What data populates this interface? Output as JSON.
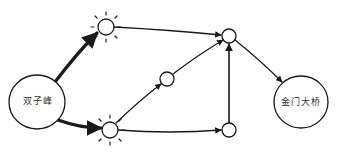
{
  "diagram": {
    "type": "directed-graph",
    "style": "hand-drawn sketch",
    "colors": {
      "stroke": "#1a1a1a",
      "background": "#ffffff",
      "text": "#333333"
    },
    "nodes": [
      {
        "id": "twin_peaks",
        "label": "双子峰",
        "kind": "large",
        "x": 37,
        "y": 102,
        "r": 27
      },
      {
        "id": "sun_top",
        "label": "",
        "kind": "highlighted",
        "x": 106,
        "y": 27,
        "r": 8
      },
      {
        "id": "sun_bottom",
        "label": "",
        "kind": "highlighted",
        "x": 110,
        "y": 130,
        "r": 8
      },
      {
        "id": "mid",
        "label": "",
        "kind": "small",
        "x": 167,
        "y": 79,
        "r": 7
      },
      {
        "id": "top_right",
        "label": "",
        "kind": "small",
        "x": 229,
        "y": 36,
        "r": 7
      },
      {
        "id": "bottom_right",
        "label": "",
        "kind": "small",
        "x": 229,
        "y": 130,
        "r": 7
      },
      {
        "id": "golden_gate",
        "label": "金门大桥",
        "kind": "large",
        "x": 301,
        "y": 102,
        "r": 26
      }
    ],
    "edges": [
      {
        "from": "twin_peaks",
        "to": "sun_top",
        "weight": "thick"
      },
      {
        "from": "twin_peaks",
        "to": "sun_bottom",
        "weight": "thick"
      },
      {
        "from": "sun_top",
        "to": "top_right",
        "weight": "normal"
      },
      {
        "from": "sun_bottom",
        "to": "mid",
        "weight": "normal"
      },
      {
        "from": "mid",
        "to": "top_right",
        "weight": "normal"
      },
      {
        "from": "sun_bottom",
        "to": "bottom_right",
        "weight": "normal"
      },
      {
        "from": "bottom_right",
        "to": "top_right",
        "weight": "normal"
      },
      {
        "from": "top_right",
        "to": "golden_gate",
        "weight": "normal"
      }
    ]
  },
  "labels": {
    "start": "双子峰",
    "end": "金门大桥"
  }
}
